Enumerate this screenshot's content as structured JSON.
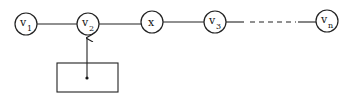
{
  "diagram": {
    "nodes": [
      {
        "id": "v1",
        "label": "v",
        "subscript": "1"
      },
      {
        "id": "v2",
        "label": "v",
        "subscript": "2"
      },
      {
        "id": "x",
        "label": "x",
        "subscript": ""
      },
      {
        "id": "v3",
        "label": "v",
        "subscript": "3"
      },
      {
        "id": "vn",
        "label": "v",
        "subscript": "n"
      }
    ],
    "edges": [
      {
        "from": "v1",
        "to": "v2",
        "style": "solid"
      },
      {
        "from": "v2",
        "to": "x",
        "style": "solid"
      },
      {
        "from": "x",
        "to": "v3",
        "style": "solid"
      },
      {
        "from": "v3",
        "to": "vn",
        "style": "dashed-middle"
      }
    ],
    "pointer": {
      "from": "box",
      "to": "v2",
      "description": "box with dot pointing to v2"
    }
  }
}
